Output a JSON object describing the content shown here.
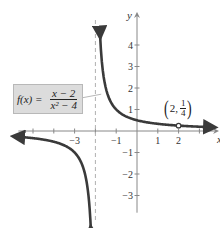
{
  "chart_data": {
    "type": "line",
    "title": "",
    "function_label": {
      "name": "f(x) =",
      "numerator": "x − 2",
      "denominator": "x² − 4"
    },
    "xlabel": "x",
    "ylabel": "y",
    "xlim": [
      -5.8,
      3.8
    ],
    "ylim": [
      -3.8,
      5.4
    ],
    "x_ticks": [
      -5,
      -4,
      -3,
      -2,
      -1,
      1,
      2,
      3
    ],
    "x_tick_labels": {
      "-3": "−3",
      "-1": "−1",
      "1": "1",
      "2": "2"
    },
    "y_ticks": [
      -3,
      -2,
      -1,
      1,
      2,
      3,
      4
    ],
    "y_tick_labels": {
      "-3": "−3",
      "-2": "−2",
      "-1": "−1",
      "1": "1",
      "2": "2",
      "3": "3",
      "4": "4"
    },
    "grid": false,
    "vertical_asymptote": -2,
    "horizontal_asymptote": 0,
    "hole": {
      "x": 2,
      "y": 0.25,
      "label_x": "2",
      "label_y_num": "1",
      "label_y_den": "4"
    },
    "series": [
      {
        "name": "left branch",
        "equivalent": "1/(x+2)",
        "x": [
          -5.8,
          -5,
          -4,
          -3,
          -2.5,
          -2.25,
          -2.15
        ],
        "y": [
          -0.26,
          -0.33,
          -0.5,
          -1,
          -2,
          -4,
          -6.67
        ]
      },
      {
        "name": "right branch",
        "equivalent": "1/(x+2), x ≠ 2",
        "x": [
          -1.82,
          -1.75,
          -1.5,
          -1,
          0,
          1,
          2,
          3,
          3.6
        ],
        "y": [
          5.5,
          4,
          2,
          1,
          0.5,
          0.33,
          0.25,
          0.2,
          0.18
        ]
      }
    ]
  },
  "colors": {
    "curve": "#3a3a3a",
    "axis": "#888888",
    "asymptote": "#b0b0b0",
    "label_box": "#dcdcdc"
  },
  "labels": {
    "point_open": "(",
    "point_x": "2,",
    "point_close": ")",
    "point_num": "1",
    "point_den": "4"
  }
}
